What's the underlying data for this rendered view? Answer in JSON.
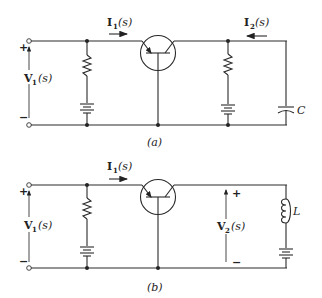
{
  "figure": {
    "circuit_a": {
      "caption": "(a)",
      "input_voltage": {
        "name": "V",
        "sub": "1",
        "arg": "(s)",
        "plus": "+",
        "minus": "−"
      },
      "input_current": {
        "name": "I",
        "sub": "1",
        "arg": "(s)"
      },
      "output_current": {
        "name": "I",
        "sub": "2",
        "arg": "(s)"
      },
      "load_label": "C",
      "components": [
        "input-terminals",
        "resistor",
        "battery",
        "transistor",
        "resistor",
        "battery",
        "capacitor"
      ]
    },
    "circuit_b": {
      "caption": "(b)",
      "input_voltage": {
        "name": "V",
        "sub": "1",
        "arg": "(s)",
        "plus": "+",
        "minus": "−"
      },
      "input_current": {
        "name": "I",
        "sub": "1",
        "arg": "(s)"
      },
      "output_voltage": {
        "name": "V",
        "sub": "2",
        "arg": "(s)",
        "plus": "+",
        "minus": "−"
      },
      "load_label": "L",
      "components": [
        "input-terminals",
        "resistor",
        "battery",
        "transistor",
        "inductor",
        "battery"
      ]
    }
  }
}
